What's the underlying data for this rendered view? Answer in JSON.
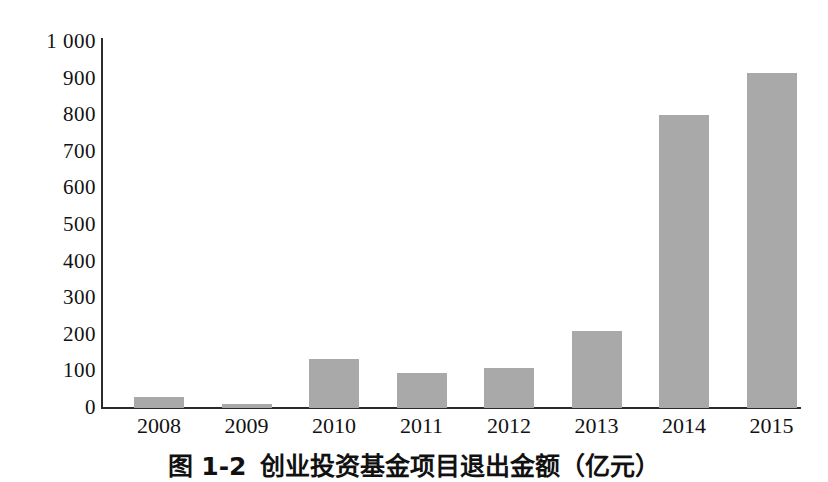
{
  "chart_data": {
    "type": "bar",
    "title": "",
    "xlabel": "",
    "ylabel": "",
    "categories": [
      "2008",
      "2009",
      "2010",
      "2011",
      "2012",
      "2013",
      "2014",
      "2015"
    ],
    "values": [
      30,
      10,
      135,
      95,
      110,
      210,
      800,
      915
    ],
    "ylim": [
      0,
      1000
    ],
    "yticks": [
      0,
      100,
      200,
      300,
      400,
      500,
      600,
      700,
      800,
      900,
      1000
    ],
    "ytick_labels": [
      "0",
      "100",
      "200",
      "300",
      "400",
      "500",
      "600",
      "700",
      "800",
      "900",
      "1 000"
    ],
    "grid": false,
    "legend": null,
    "bar_color": "#a9a9a9",
    "axis_color": "#2b2b2b"
  },
  "caption": {
    "number": "图 1-2",
    "text": "创业投资基金项目退出金额（亿元）"
  }
}
